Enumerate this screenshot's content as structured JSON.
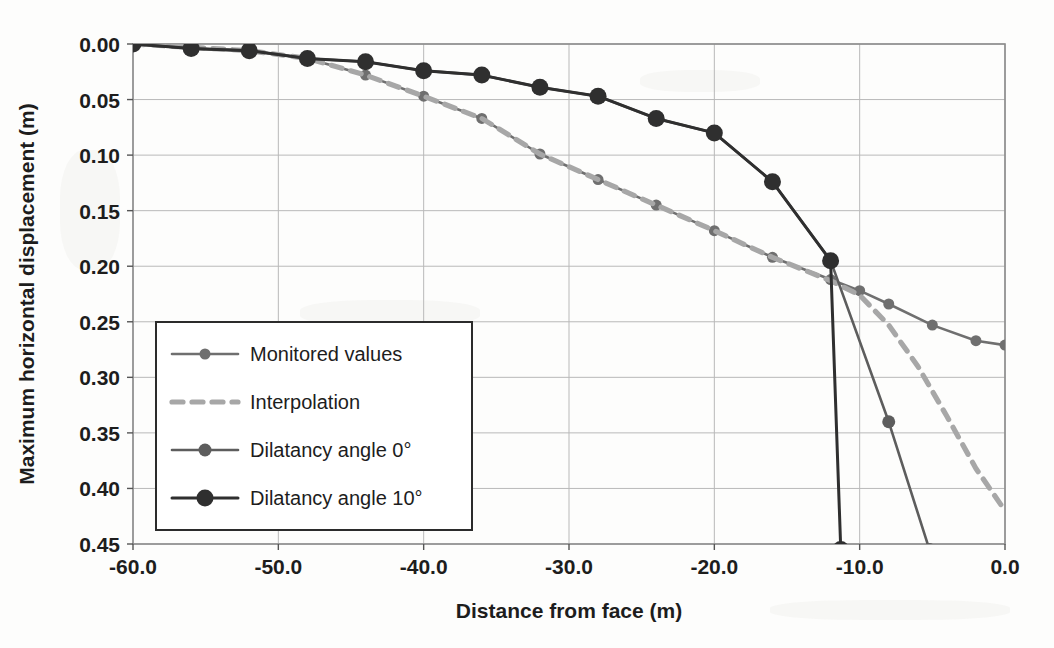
{
  "chart_data": {
    "type": "line",
    "title": "",
    "xlabel": "Distance from face (m)",
    "ylabel": "Maximum horizontal displacement (m)",
    "xlim": [
      -60.0,
      0.0
    ],
    "ylim": [
      0.45,
      0.0
    ],
    "y_inverted": true,
    "grid": true,
    "legend_position": "inner-left-lower",
    "x_ticks": [
      "-60.0",
      "-50.0",
      "-40.0",
      "-30.0",
      "-20.0",
      "-10.0",
      "0.0"
    ],
    "x_tick_values": [
      -60,
      -50,
      -40,
      -30,
      -20,
      -10,
      0
    ],
    "y_ticks": [
      "0.00",
      "0.05",
      "0.10",
      "0.15",
      "0.20",
      "0.25",
      "0.30",
      "0.35",
      "0.40",
      "0.45"
    ],
    "y_tick_values": [
      0.0,
      0.05,
      0.1,
      0.15,
      0.2,
      0.25,
      0.3,
      0.35,
      0.4,
      0.45
    ],
    "series": [
      {
        "name": "Monitored values",
        "color": "#6f6f6f",
        "style": "solid",
        "marker": "circle-small",
        "x": [
          -60,
          -56,
          -52,
          -48,
          -44,
          -40,
          -36,
          -32,
          -28,
          -24,
          -20,
          -16,
          -12,
          -10,
          -8,
          -5,
          -2,
          0
        ],
        "values": [
          0.0,
          0.004,
          0.006,
          0.013,
          0.028,
          0.047,
          0.067,
          0.099,
          0.122,
          0.145,
          0.168,
          0.192,
          0.212,
          0.222,
          0.234,
          0.253,
          0.267,
          0.271
        ]
      },
      {
        "name": "Interpolation",
        "color": "#a7a7a7",
        "style": "dashed",
        "marker": "none",
        "x": [
          -60,
          -52,
          -48,
          -44,
          -40,
          -36,
          -32,
          -28,
          -24,
          -20,
          -16,
          -12,
          -10,
          -8,
          -6,
          -4,
          -2,
          0
        ],
        "values": [
          0.0,
          0.006,
          0.013,
          0.028,
          0.047,
          0.067,
          0.099,
          0.122,
          0.145,
          0.168,
          0.192,
          0.213,
          0.226,
          0.253,
          0.29,
          0.335,
          0.382,
          0.42
        ]
      },
      {
        "name": "Dilatancy angle 0°",
        "color": "#5d5d5d",
        "style": "solid",
        "marker": "circle",
        "x": [
          -60,
          -56,
          -52,
          -48,
          -44,
          -40,
          -36,
          -32,
          -28,
          -24,
          -20,
          -16,
          -12,
          -8,
          -5.2
        ],
        "values": [
          0.0,
          0.004,
          0.006,
          0.013,
          0.016,
          0.024,
          0.028,
          0.039,
          0.047,
          0.067,
          0.08,
          0.124,
          0.195,
          0.34,
          0.455
        ]
      },
      {
        "name": "Dilatancy angle 10°",
        "color": "#2f2f2f",
        "style": "solid",
        "marker": "circle-large",
        "x": [
          -60,
          -56,
          -52,
          -48,
          -44,
          -40,
          -36,
          -32,
          -28,
          -24,
          -20,
          -16,
          -12,
          -11.3
        ],
        "values": [
          0.0,
          0.004,
          0.006,
          0.013,
          0.016,
          0.024,
          0.028,
          0.039,
          0.047,
          0.067,
          0.08,
          0.124,
          0.195,
          0.455
        ]
      }
    ],
    "annotations": []
  },
  "legend": {
    "items": [
      {
        "label": "Monitored values"
      },
      {
        "label": "Interpolation"
      },
      {
        "label": "Dilatancy angle 0°"
      },
      {
        "label": "Dilatancy angle 10°"
      }
    ]
  }
}
